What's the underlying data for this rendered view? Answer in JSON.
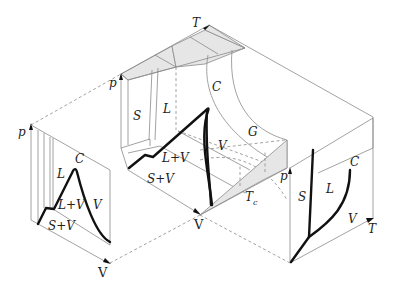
{
  "figure": {
    "main_surface": {
      "axes": {
        "pressure": "p",
        "volume": "V",
        "temperature": "T"
      },
      "regions": {
        "solid": "S",
        "liquid": "L",
        "gas": "G",
        "vapor": "V",
        "liquid_vapor": "L+V",
        "solid_vapor": "S+V"
      },
      "critical_point": "C",
      "critical_temperature": "T",
      "critical_temperature_sub": "c"
    },
    "pv_projection": {
      "axes": {
        "pressure": "p",
        "volume": "V"
      },
      "regions": {
        "liquid": "L",
        "vapor": "V",
        "liquid_vapor": "L+V",
        "solid_vapor": "S+V"
      },
      "critical_point": "C"
    },
    "pt_projection": {
      "axes": {
        "pressure": "p",
        "temperature": "T"
      },
      "regions": {
        "solid": "S",
        "liquid": "L",
        "vapor": "V"
      },
      "critical_point": "C"
    }
  }
}
